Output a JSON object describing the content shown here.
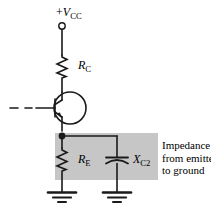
{
  "diagram": {
    "background_color": "#ffffff",
    "line_color": "#1a1a1a",
    "shade_color": "#c6c6c6"
  },
  "labels": {
    "supply": {
      "prefix": "+",
      "symbol": "V",
      "subscript": "CC"
    },
    "collector_resistor": {
      "symbol": "R",
      "subscript": "C"
    },
    "emitter_resistor": {
      "symbol": "R",
      "subscript": "E"
    },
    "bypass_capacitor_reactance": {
      "symbol": "X",
      "subscript": "C2"
    }
  },
  "annotation": {
    "line1": "Impedance",
    "line2": "from emitter",
    "line3": "to ground"
  },
  "components": {
    "supply_terminal": "open-circle-terminal",
    "transistor": "npn-bjt",
    "base_lead": "dash-dot-line",
    "emitter_node": "junction-dot",
    "ground_left": "earth-ground-symbol",
    "ground_right": "earth-ground-symbol"
  }
}
